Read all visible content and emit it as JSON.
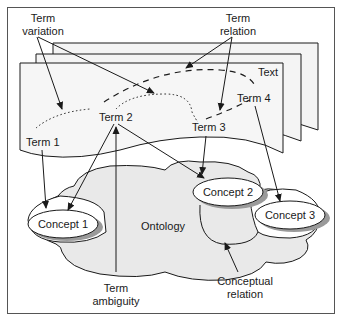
{
  "diagram": {
    "pages_label": "Text",
    "ontology_label": "Ontology",
    "terms": [
      {
        "id": "term1",
        "label": "Term 1"
      },
      {
        "id": "term2",
        "label": "Term 2"
      },
      {
        "id": "term3",
        "label": "Term 3"
      },
      {
        "id": "term4",
        "label": "Term 4"
      }
    ],
    "concepts": [
      {
        "id": "concept1",
        "label": "Concept 1"
      },
      {
        "id": "concept2",
        "label": "Concept 2"
      },
      {
        "id": "concept3",
        "label": "Concept 3"
      }
    ],
    "annotations": {
      "term_variation": {
        "line1": "Term",
        "line2": "variation"
      },
      "term_relation": {
        "line1": "Term",
        "line2": "relation"
      },
      "term_ambiguity": {
        "line1": "Term",
        "line2": "ambiguity"
      },
      "conceptual_relation": {
        "line1": "Conceptual",
        "line2": "relation"
      }
    },
    "edges": [
      {
        "from": "Term 1",
        "to": "Concept 1"
      },
      {
        "from": "Term 2",
        "to": "Concept 1"
      },
      {
        "from": "Term 2",
        "to": "Concept 2"
      },
      {
        "from": "Term 3",
        "to": "Concept 2"
      },
      {
        "from": "Term 4",
        "to": "Concept 3"
      }
    ],
    "colors": {
      "page_fill": "#f4f4f4",
      "cloud_fill": "#e9e9e9",
      "ellipse_fill": "#ffffff",
      "shadow": "#9a9a9a",
      "stroke": "#1a1a1a",
      "border": "#555555"
    }
  }
}
